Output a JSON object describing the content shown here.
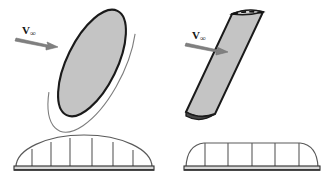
{
  "figure": {
    "background_color": "#ffffff",
    "outline_color": "#1a1a1a",
    "wing_fill_color": "#c4c4c4",
    "wing_edge_shadow_color": "#4a4a4a",
    "distribution_line_color": "#5a5a5a",
    "base_bar_color": "#3a3a3a"
  },
  "panels": [
    {
      "id": "elliptical-wing",
      "side": "left",
      "planform_type": "elliptical",
      "velocity_label": {
        "symbol": "V",
        "subscript": "∞",
        "full": "V∞"
      },
      "arrow": {
        "name": "freestream-arrow",
        "direction": "right-down",
        "x1": 16,
        "y1": 38,
        "x2": 58,
        "y2": 47
      },
      "lift_distribution": {
        "type": "elliptical",
        "station_count": 6,
        "span_start": 16,
        "span_end": 152,
        "peak_height": 30,
        "stations": [
          {
            "x": 0.12,
            "height": 0.6
          },
          {
            "x": 0.26,
            "height": 0.84
          },
          {
            "x": 0.4,
            "height": 0.97
          },
          {
            "x": 0.56,
            "height": 0.98
          },
          {
            "x": 0.71,
            "height": 0.87
          },
          {
            "x": 0.86,
            "height": 0.62
          }
        ]
      }
    },
    {
      "id": "rectangular-wing",
      "side": "right",
      "planform_type": "rectangular",
      "velocity_label": {
        "symbol": "V",
        "subscript": "∞",
        "full": "V∞"
      },
      "arrow": {
        "name": "freestream-arrow",
        "direction": "right-down",
        "x1": 186,
        "y1": 43,
        "x2": 228,
        "y2": 52
      },
      "tip_edge_style": "dashed",
      "lift_distribution": {
        "type": "flat-rounded",
        "station_count": 5,
        "span_start": 186,
        "span_end": 318,
        "peak_height": 24,
        "stations": [
          {
            "x": 0.14,
            "height": 0.92
          },
          {
            "x": 0.31,
            "height": 1.0
          },
          {
            "x": 0.49,
            "height": 1.0
          },
          {
            "x": 0.66,
            "height": 0.99
          },
          {
            "x": 0.84,
            "height": 0.93
          }
        ]
      }
    }
  ]
}
